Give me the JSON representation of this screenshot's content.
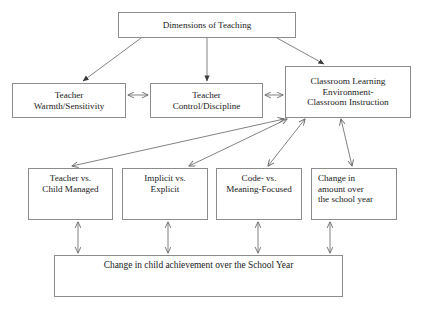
{
  "diagram": {
    "title_node": "Dimensions of Teaching",
    "type": "flowchart",
    "background_color": "#ffffff",
    "border_color": "#8c8c8c",
    "text_color": "#1a1a1a",
    "nodes": [
      {
        "id": "dimensions",
        "label": "Dimensions of Teaching"
      },
      {
        "id": "warmth",
        "label": "Teacher\nWarmth/Sensitivity"
      },
      {
        "id": "control",
        "label": "Teacher\nControl/Discipline"
      },
      {
        "id": "classroom",
        "label": "Classroom Learning\nEnvironment-\nClassroom Instruction"
      },
      {
        "id": "managed",
        "label": "Teacher vs.\nChild Managed"
      },
      {
        "id": "implicit",
        "label": "Implicit vs.\nExplicit"
      },
      {
        "id": "code",
        "label": "Code- vs.\nMeaning-Focused"
      },
      {
        "id": "amount",
        "label": "Change in\namount over\nthe school year"
      },
      {
        "id": "achievement",
        "label": "Change in child achievement over the School Year"
      }
    ],
    "edges": [
      {
        "from": "dimensions",
        "to": "warmth",
        "style": "single-arrow"
      },
      {
        "from": "dimensions",
        "to": "control",
        "style": "single-arrow"
      },
      {
        "from": "dimensions",
        "to": "classroom",
        "style": "single-arrow"
      },
      {
        "from": "warmth",
        "to": "control",
        "style": "double-arrow"
      },
      {
        "from": "control",
        "to": "classroom",
        "style": "double-arrow"
      },
      {
        "from": "classroom",
        "to": "managed",
        "style": "double-arrow"
      },
      {
        "from": "classroom",
        "to": "implicit",
        "style": "double-arrow"
      },
      {
        "from": "classroom",
        "to": "code",
        "style": "double-arrow"
      },
      {
        "from": "classroom",
        "to": "amount",
        "style": "double-arrow"
      },
      {
        "from": "managed",
        "to": "achievement",
        "style": "double-arrow"
      },
      {
        "from": "implicit",
        "to": "achievement",
        "style": "double-arrow"
      },
      {
        "from": "code",
        "to": "achievement",
        "style": "double-arrow"
      },
      {
        "from": "amount",
        "to": "achievement",
        "style": "double-arrow"
      }
    ]
  }
}
